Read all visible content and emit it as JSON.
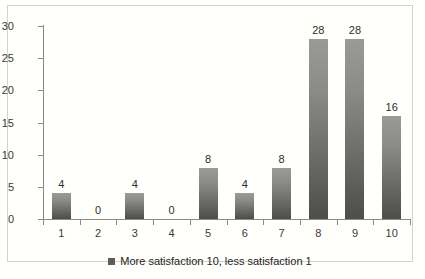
{
  "chart_data": {
    "type": "bar",
    "title": "",
    "xlabel": "",
    "ylabel": "",
    "categories": [
      "1",
      "2",
      "3",
      "4",
      "5",
      "6",
      "7",
      "8",
      "9",
      "10"
    ],
    "values": [
      4,
      0,
      4,
      0,
      8,
      4,
      8,
      28,
      28,
      16
    ],
    "data_labels": [
      "4",
      "0",
      "4",
      "0",
      "8",
      "4",
      "8",
      "28",
      "28",
      "16"
    ],
    "ylim": [
      0,
      30
    ],
    "ytick_values": [
      0,
      5,
      10,
      15,
      20,
      25,
      30
    ],
    "ytick_labels": [
      "0",
      "5",
      "10",
      "15",
      "20",
      "25",
      "30"
    ],
    "grid": false,
    "legend": {
      "position": "bottom-center",
      "entries": [
        {
          "label": "More satisfaction 10, less satisfaction 1",
          "marker": "square",
          "color": "#5d5d5b"
        }
      ]
    },
    "series": [
      {
        "name": "More satisfaction 10, less satisfaction 1",
        "values": [
          4,
          0,
          4,
          0,
          8,
          4,
          8,
          28,
          28,
          16
        ],
        "color": "#6e6e6c"
      }
    ],
    "colors": {
      "bar_top": "#9a9a98",
      "bar_bottom": "#4d4d4b",
      "axis": "#8a8a8a",
      "text": "#3a3a38",
      "background": "#fffffc",
      "frame_border": "#d2d2cf"
    }
  }
}
